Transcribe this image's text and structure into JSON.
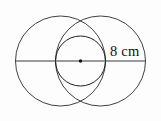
{
  "figure": {
    "background_color": "#fdfdfd",
    "stroke_color": "#2b2b2b",
    "label_color": "#111111",
    "width": 161,
    "height": 121
  },
  "labels": {
    "measurement": "8 cm"
  },
  "chart_data": {
    "type": "diagram",
    "subtype": "geometric-circles",
    "units": "cm",
    "annotations": [
      {
        "text": "8 cm",
        "x": 110,
        "y": 56,
        "refers_to": "radius-of-large-circle",
        "value": 8
      }
    ],
    "shapes": [
      {
        "name": "large-circle-left",
        "type": "circle",
        "cx": 60.5,
        "cy": 61,
        "r": 45
      },
      {
        "name": "large-circle-right",
        "type": "circle",
        "cx": 100.5,
        "cy": 61,
        "r": 45
      },
      {
        "name": "small-circle-center",
        "type": "circle",
        "cx": 80.5,
        "cy": 61,
        "r": 25
      },
      {
        "name": "horizontal-diameter",
        "type": "line",
        "x1": 15.5,
        "y1": 61,
        "x2": 145.5,
        "y2": 61
      },
      {
        "name": "center-point",
        "type": "point",
        "cx": 80.5,
        "cy": 61,
        "r": 1.7
      }
    ],
    "axis": {
      "show": false
    },
    "grid": false,
    "legend": {
      "show": false
    }
  }
}
